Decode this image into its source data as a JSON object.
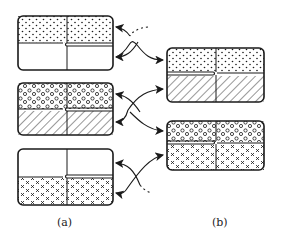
{
  "figure": {
    "panels": [
      {
        "id": "a",
        "label": "(a)",
        "cells": [
          {
            "name": "cell-a1",
            "top_fill": "dots",
            "bottom_fill": "empty"
          },
          {
            "name": "cell-a2",
            "top_fill": "circles",
            "bottom_fill": "hatch"
          },
          {
            "name": "cell-a3",
            "top_fill": "empty",
            "bottom_fill": "crosses"
          }
        ]
      },
      {
        "id": "b",
        "label": "(b)",
        "cells": [
          {
            "name": "cell-b1",
            "top_fill": "dots",
            "bottom_fill": "hatch"
          },
          {
            "name": "cell-b2",
            "top_fill": "circles",
            "bottom_fill": "crosses"
          }
        ]
      }
    ],
    "colors": {
      "ink": "#1a1a1a",
      "background": "#ffffff"
    }
  }
}
